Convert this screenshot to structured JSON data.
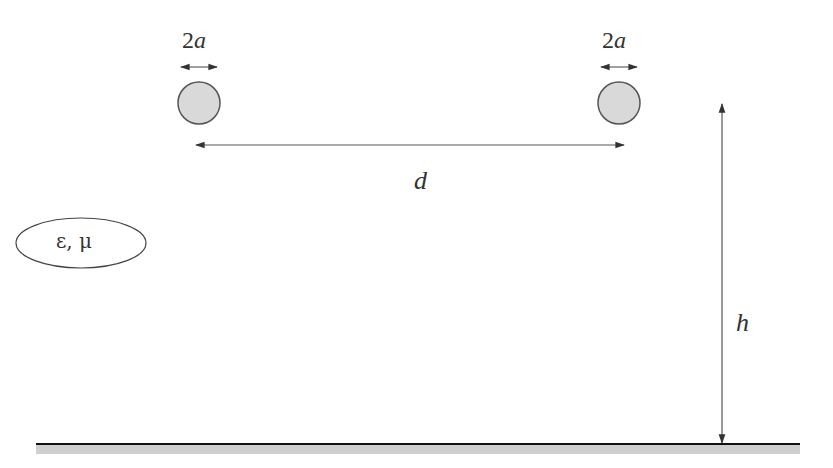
{
  "diagram": {
    "type": "two-wire transmission line above ground plane",
    "labels": {
      "left_diameter": "2a",
      "right_diameter": "2a",
      "separation": "d",
      "height": "h",
      "medium": "ε, μ"
    },
    "elements": {
      "left_conductor": {
        "cx": 199,
        "cy": 103,
        "r": 21
      },
      "right_conductor": {
        "cx": 619,
        "cy": 103,
        "r": 21
      },
      "separation_arrow": {
        "x1": 195,
        "x2": 625,
        "y": 145
      },
      "height_arrow": {
        "x": 722,
        "y1": 103,
        "y2": 444
      },
      "ground_plane": {
        "x1": 36,
        "x2": 800,
        "y": 444
      }
    },
    "colors": {
      "conductor_fill": "#d9d9d9",
      "conductor_stroke": "#555555",
      "line": "#444444",
      "ground_line": "#111111",
      "ground_band": "#cfcfcf"
    }
  }
}
